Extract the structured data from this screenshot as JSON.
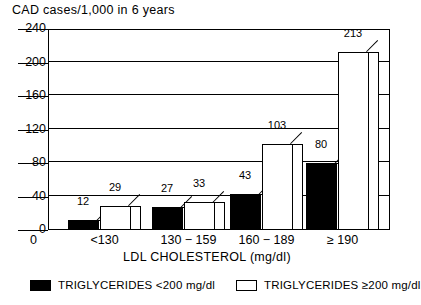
{
  "chart_data": {
    "type": "bar",
    "title": "CAD cases/1,000 in 6 years",
    "xlabel": "LDL CHOLESTEROL (mg/dl)",
    "ylabel": "CAD cases/1,000 in 6 years",
    "ylim": [
      0,
      240
    ],
    "yticks": [
      0,
      40,
      80,
      120,
      160,
      200,
      240
    ],
    "ytick_labels": [
      "0",
      "40",
      "80",
      "120",
      "160",
      "200",
      "240"
    ],
    "grid": true,
    "grid_axis": "y",
    "legend_position": "bottom",
    "categories": [
      "<130",
      "130 − 159",
      "160 − 189",
      "≥ 190"
    ],
    "series": [
      {
        "name": "TRIGLYCERIDES <200 mg/dl",
        "color": "#000000",
        "values": [
          12,
          27,
          43,
          80
        ],
        "value_labels": [
          "12",
          "27",
          "43",
          "80"
        ]
      },
      {
        "name": "TRIGLYCERIDES ≥200 mg/dl",
        "color": "#ffffff",
        "values": [
          29,
          33,
          103,
          213
        ],
        "value_labels": [
          "29",
          "33",
          "103",
          "213"
        ]
      }
    ]
  },
  "legend": {
    "items": [
      {
        "label": "TRIGLYCERIDES <200 mg/dl",
        "swatch": "dark"
      },
      {
        "label": "TRIGLYCERIDES ≥200 mg/dl",
        "swatch": "light"
      }
    ]
  }
}
